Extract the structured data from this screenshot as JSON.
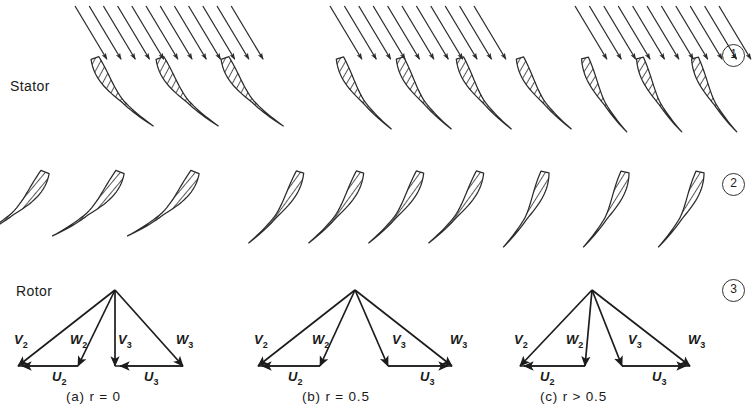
{
  "figure": {
    "row_labels": {
      "stator": "Stator",
      "rotor": "Rotor"
    },
    "station_numbers": [
      "1",
      "2",
      "3"
    ],
    "captions": [
      {
        "id": "a",
        "text": "(a)  r = 0"
      },
      {
        "id": "b",
        "text": "(b)  r = 0.5"
      },
      {
        "id": "c",
        "text": "(c)  r > 0.5"
      }
    ],
    "vector_labels": {
      "v2": "V",
      "v2_sub": "2",
      "w2": "W",
      "w2_sub": "2",
      "u2": "U",
      "u2_sub": "2",
      "v3": "V",
      "v3_sub": "3",
      "w3": "W",
      "w3_sub": "3",
      "u3": "U",
      "u3_sub": "3"
    },
    "colors": {
      "ink": "#1c1c1c",
      "line": "#2b2b2b",
      "hatch": "#3a3a3a",
      "background": "#ffffff"
    }
  },
  "chart_data": {
    "type": "diagram",
    "xlabel": "",
    "ylabel": "",
    "grid": false,
    "legend": "none",
    "rows": [
      {
        "name": "inlet-flow-arrows",
        "description": "Parallel inclined arrows entering stator row"
      },
      {
        "name": "stator-row",
        "description": "Stator (nozzle) blade cascade, station 1 to 2"
      },
      {
        "name": "rotor-row",
        "description": "Rotor blade cascade, station 2 to 3"
      },
      {
        "name": "velocity-triangles",
        "description": "Inlet and exit velocity triangles at stations 2 and 3"
      }
    ],
    "cases": [
      {
        "id": "a",
        "label": "(a)  r = 0",
        "reaction": 0,
        "stator_turning_deg": 72,
        "rotor_turning_deg": 118,
        "triangle": {
          "U2": 1.0,
          "U3": 1.0,
          "V2_angle_deg": 68,
          "W2_angle_deg": 50,
          "V3_angle_deg": 90,
          "W3_angle_deg": 50,
          "note": "Impulse stage: V3 purely axial, W2 equals W3 in magnitude"
        }
      },
      {
        "id": "b",
        "label": "(b)  r = 0.5",
        "reaction": 0.5,
        "stator_turning_deg": 58,
        "rotor_turning_deg": 58,
        "triangle": {
          "U2": 1.0,
          "U3": 1.0,
          "V2_angle_deg": 62,
          "W2_angle_deg": 44,
          "V3_angle_deg": 62,
          "W3_angle_deg": 44,
          "note": "Symmetric fifty-percent reaction stage: triangles are mirror images"
        }
      },
      {
        "id": "c",
        "label": "(c)  r > 0.5",
        "reaction": 0.7,
        "stator_turning_deg": 44,
        "rotor_turning_deg": 78,
        "triangle": {
          "U2": 0.78,
          "U3": 0.78,
          "V2_angle_deg": 58,
          "W2_angle_deg": 64,
          "V3_angle_deg": 64,
          "W3_angle_deg": 42,
          "note": "High reaction: rotor relative velocity accelerates strongly"
        }
      }
    ],
    "annotations": [
      {
        "text": "Stator",
        "x": 10,
        "y": 86
      },
      {
        "text": "Rotor",
        "x": 16,
        "y": 291
      },
      {
        "text": "1",
        "x": 733,
        "y": 55
      },
      {
        "text": "2",
        "x": 733,
        "y": 184
      },
      {
        "text": "3",
        "x": 733,
        "y": 290
      }
    ]
  }
}
